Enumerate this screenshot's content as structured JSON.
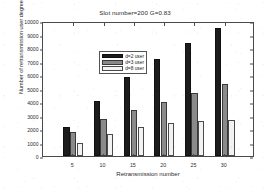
{
  "chart_data": {
    "type": "bar",
    "title": "Slot number=200 G=0.83",
    "xlabel": "Retransmission number",
    "ylabel": "Number of retransmission user degree",
    "categories": [
      "5",
      "10",
      "15",
      "20",
      "25",
      "30"
    ],
    "series": [
      {
        "name": "d=2 user",
        "color": "#1c1c1c",
        "values": [
          2150,
          4080,
          5830,
          7200,
          8400,
          9450
        ]
      },
      {
        "name": "d=3 user",
        "color": "#8a8a8a",
        "values": [
          1780,
          2720,
          3380,
          4030,
          4680,
          5300
        ]
      },
      {
        "name": "d=8 user",
        "color": "#f2f2f2",
        "values": [
          960,
          1600,
          2120,
          2450,
          2620,
          2680
        ]
      }
    ],
    "ylim": [
      0,
      10000
    ],
    "ytick_labels": [
      "0",
      "1000",
      "2000",
      "3000",
      "4000",
      "5000",
      "6000",
      "7000",
      "8000",
      "9000",
      "10000"
    ],
    "ytick_values": [
      0,
      1000,
      2000,
      3000,
      4000,
      5000,
      6000,
      7000,
      8000,
      9000,
      10000
    ],
    "xtick_labels": [
      "5",
      "10",
      "15",
      "20",
      "25",
      "30"
    ],
    "xlim": [
      0,
      35
    ],
    "xtick_values": [
      5,
      10,
      15,
      20,
      25,
      30
    ],
    "grid": false,
    "legend_position": "upper-left",
    "frame": true
  }
}
